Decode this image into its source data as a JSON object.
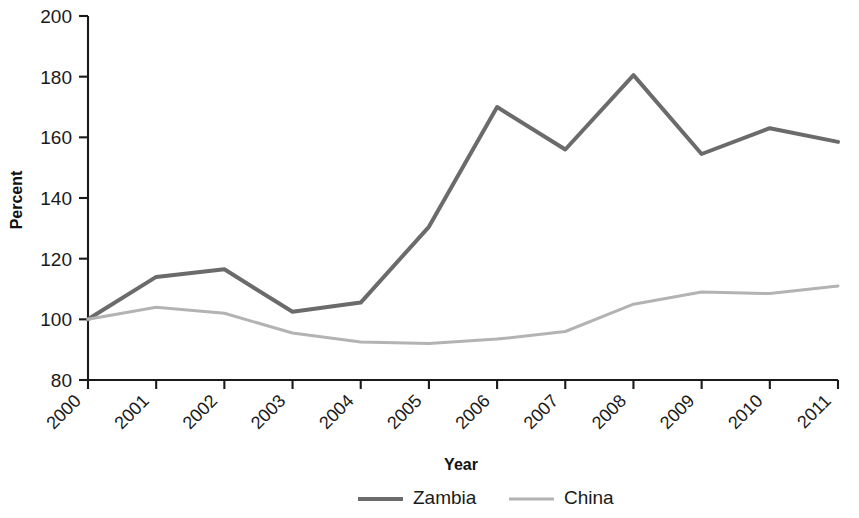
{
  "chart_data": {
    "type": "line",
    "title": "",
    "xlabel": "Year",
    "ylabel": "Percent",
    "categories": [
      "2000",
      "2001",
      "2002",
      "2003",
      "2004",
      "2005",
      "2006",
      "2007",
      "2008",
      "2009",
      "2010",
      "2011"
    ],
    "x": [
      2000,
      2001,
      2002,
      2003,
      2004,
      2005,
      2006,
      2007,
      2008,
      2009,
      2010,
      2011
    ],
    "series": [
      {
        "name": "Zambia",
        "color": "#6b6b6b",
        "line_width": 4,
        "values": [
          100,
          114,
          116.5,
          102.5,
          105.5,
          130.5,
          170,
          156,
          180.5,
          154.5,
          163,
          158.5
        ]
      },
      {
        "name": "China",
        "color": "#b3b3b3",
        "line_width": 3,
        "values": [
          100,
          104,
          102,
          95.5,
          92.5,
          92,
          93.5,
          96,
          105,
          109,
          108.5,
          111
        ]
      }
    ],
    "ylim": [
      80,
      200
    ],
    "yticks": [
      80,
      100,
      120,
      140,
      160,
      180,
      200
    ],
    "ytick_labels": [
      "80",
      "100",
      "120",
      "140",
      "160",
      "180",
      "200"
    ],
    "xlim": [
      2000,
      2011
    ],
    "grid": false,
    "legend_position": "bottom-center",
    "legend_entries": [
      "Zambia",
      "China"
    ]
  },
  "axis": {
    "y_title": "Percent",
    "x_title": "Year"
  },
  "legend": {
    "items": [
      {
        "label": "Zambia"
      },
      {
        "label": "China"
      }
    ]
  }
}
